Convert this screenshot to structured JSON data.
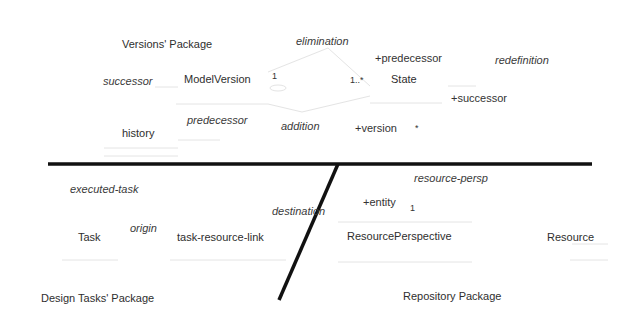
{
  "colors": {
    "divider": "#111111",
    "faint_line": "#e3e3e3",
    "text": "#333333"
  },
  "packages": {
    "versions": {
      "title": "Versions' Package",
      "classes": {
        "model_version": "ModelVersion",
        "state": "State",
        "history": "History"
      },
      "associations": {
        "successor": "successor",
        "predecessor": "predecessor",
        "elimination": "elimination",
        "addition": "addition",
        "redefinition": "redefinition"
      },
      "roles": {
        "plus_predecessor": "+predecessor",
        "plus_successor": "+successor",
        "plus_version": "+version"
      },
      "multiplicities": {
        "model_version_end": "1",
        "state_end": "1..*",
        "version_star": "*"
      }
    },
    "design_tasks": {
      "title": "Design Tasks' Package",
      "classes": {
        "task": "Task",
        "task_resource_link": "task-resource-link"
      },
      "associations": {
        "executed_task": "executed-task",
        "origin": "origin",
        "destination": "destination"
      }
    },
    "repository": {
      "title": "Repository Package",
      "classes": {
        "resource_perspective": "ResourcePerspective",
        "resource": "Resource"
      },
      "associations": {
        "resource_persp": "resource-persp"
      },
      "roles": {
        "plus_entity": "+entity"
      },
      "multiplicities": {
        "entity_end": "1"
      }
    }
  }
}
